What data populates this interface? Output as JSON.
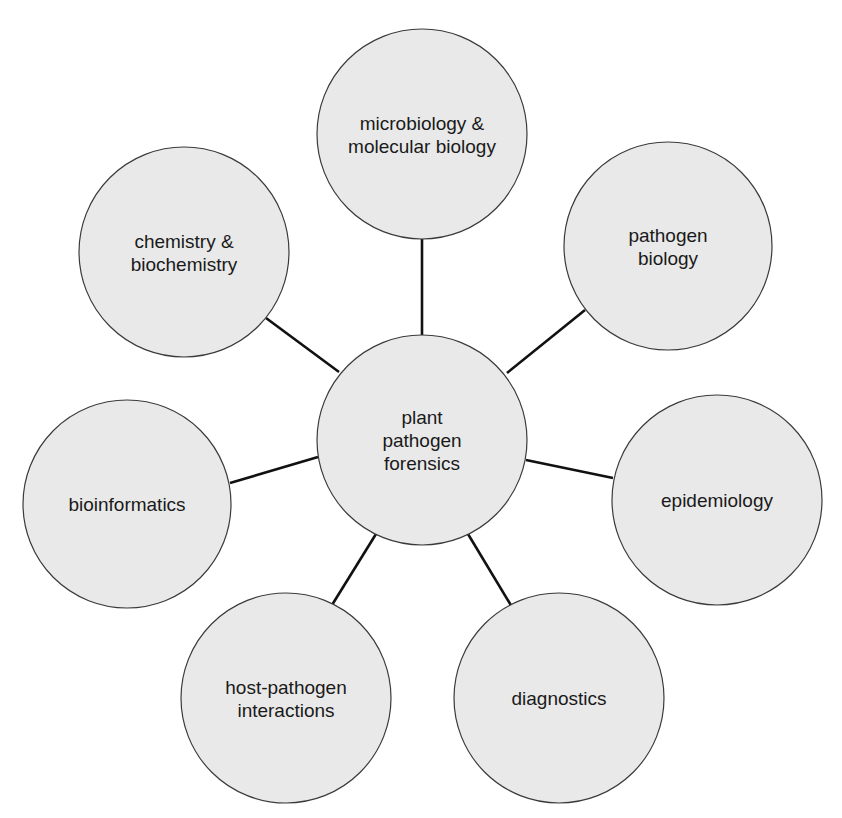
{
  "diagram": {
    "type": "hub-and-spoke concept map",
    "colors": {
      "background": "#ffffff",
      "node_fill": "#e9e9e9",
      "node_stroke": "#3a3a3a",
      "connector": "#111111",
      "text": "#1a1a1a"
    },
    "center": {
      "id": "center",
      "lines": [
        "plant",
        "pathogen",
        "forensics"
      ],
      "cx": 422,
      "cy": 440,
      "r": 105
    },
    "nodes": [
      {
        "id": "microbiology",
        "lines": [
          "microbiology &",
          "molecular biology"
        ],
        "cx": 422,
        "cy": 134,
        "r": 105,
        "edge": {
          "x1": 422,
          "y1": 335,
          "x2": 422,
          "y2": 239
        }
      },
      {
        "id": "pathogen-biology",
        "lines": [
          "pathogen",
          "biology"
        ],
        "cx": 668,
        "cy": 246,
        "r": 104,
        "edge": {
          "x1": 507,
          "y1": 373,
          "x2": 585,
          "y2": 310
        }
      },
      {
        "id": "epidemiology",
        "lines": [
          "epidemiology"
        ],
        "cx": 717,
        "cy": 500,
        "r": 105,
        "edge": {
          "x1": 526,
          "y1": 460,
          "x2": 613,
          "y2": 478
        }
      },
      {
        "id": "diagnostics",
        "lines": [
          "diagnostics"
        ],
        "cx": 559,
        "cy": 698,
        "r": 105,
        "edge": {
          "x1": 468,
          "y1": 534,
          "x2": 512,
          "y2": 607
        }
      },
      {
        "id": "host-pathogen",
        "lines": [
          "host-pathogen",
          "interactions"
        ],
        "cx": 286,
        "cy": 698,
        "r": 105,
        "edge": {
          "x1": 376,
          "y1": 534,
          "x2": 332,
          "y2": 605
        }
      },
      {
        "id": "bioinformatics",
        "lines": [
          "bioinformatics"
        ],
        "cx": 127,
        "cy": 504,
        "r": 104,
        "edge": {
          "x1": 318,
          "y1": 457,
          "x2": 230,
          "y2": 483
        }
      },
      {
        "id": "chemistry",
        "lines": [
          "chemistry &",
          "biochemistry"
        ],
        "cx": 184,
        "cy": 252,
        "r": 105,
        "edge": {
          "x1": 339,
          "y1": 372,
          "x2": 266,
          "y2": 318
        }
      }
    ]
  }
}
